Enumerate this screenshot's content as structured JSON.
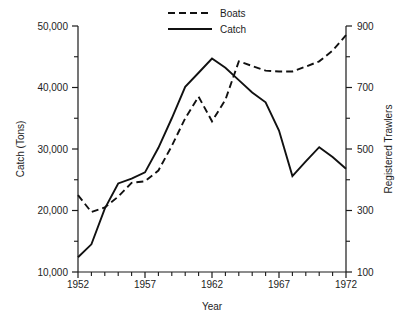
{
  "chart_data": {
    "type": "line",
    "title": "",
    "subtitle": "",
    "xlabel": "Year",
    "ylabel": "Catch (Tons)",
    "y2label": "Registered Trawlers",
    "grid": false,
    "legend_position": "top-center",
    "x": [
      1952,
      1953,
      1954,
      1955,
      1956,
      1957,
      1958,
      1959,
      1960,
      1961,
      1962,
      1963,
      1964,
      1965,
      1966,
      1967,
      1968,
      1969,
      1970,
      1971,
      1972
    ],
    "xlim": [
      1952,
      1972
    ],
    "ylim": [
      10000,
      50000
    ],
    "y2lim": [
      100,
      900
    ],
    "x_tick_labels": [
      "1952",
      "1957",
      "1962",
      "1967",
      "1972"
    ],
    "x_tick_values": [
      1952,
      1957,
      1962,
      1967,
      1972
    ],
    "y_tick_labels": [
      "10,000",
      "20,000",
      "30,000",
      "40,000",
      "50,000"
    ],
    "y_tick_values": [
      10000,
      20000,
      30000,
      40000,
      50000
    ],
    "y_minor_tick_values": [
      15000,
      25000,
      35000,
      45000
    ],
    "y2_tick_labels": [
      "100",
      "300",
      "500",
      "700",
      "900"
    ],
    "y2_tick_values": [
      100,
      300,
      500,
      700,
      900
    ],
    "y2_minor_tick_values": [
      200,
      400,
      600,
      800
    ],
    "series": [
      {
        "name": "Boats",
        "axis": "right",
        "style": "dashed",
        "color": "#111111",
        "values": [
          350,
          295,
          310,
          345,
          390,
          395,
          430,
          510,
          600,
          670,
          590,
          660,
          785,
          770,
          755,
          752,
          752,
          768,
          785,
          820,
          870
        ]
      },
      {
        "name": "Catch",
        "axis": "left",
        "style": "solid",
        "color": "#111111",
        "values": [
          12400,
          14500,
          20300,
          24400,
          25200,
          26200,
          30200,
          35000,
          40100,
          42400,
          44700,
          43200,
          41200,
          39200,
          37600,
          33000,
          25600,
          28000,
          30300,
          28700,
          26800
        ]
      }
    ],
    "legend": [
      {
        "label": "Boats",
        "style": "dashed"
      },
      {
        "label": "Catch",
        "style": "solid"
      }
    ]
  },
  "axis": {
    "left_title": "Catch (Tons)",
    "right_title": "Registered Trawlers",
    "bottom_title": "Year"
  },
  "colors": {
    "line": "#111111",
    "axis": "#1a1a1a",
    "background": "#ffffff"
  }
}
